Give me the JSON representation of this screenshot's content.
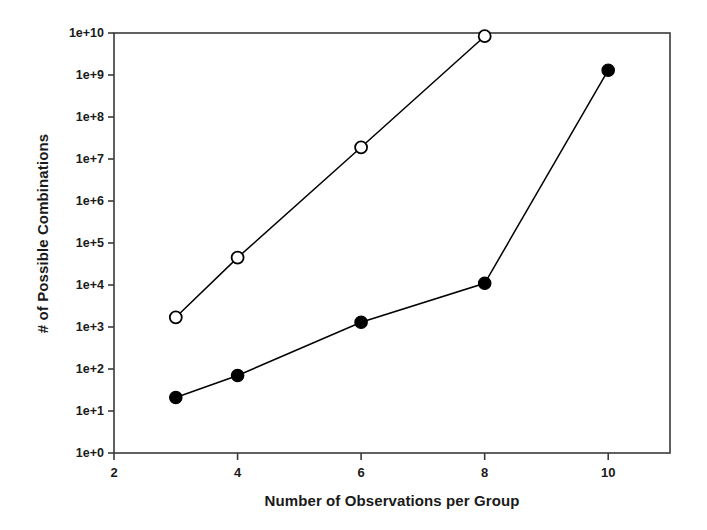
{
  "chart_data": {
    "type": "line",
    "title": "",
    "xlabel": "Number of Observations per Group",
    "ylabel": "# of Possible Combinations",
    "xlim": [
      2,
      11
    ],
    "ylim": [
      1,
      10000000000
    ],
    "yscale": "log",
    "grid": false,
    "legend": "none",
    "xticks": [
      "2",
      "4",
      "6",
      "8",
      "10"
    ],
    "xtick_values": [
      2,
      4,
      6,
      8,
      10
    ],
    "yticks": [
      "1e+0",
      "1e+1",
      "1e+2",
      "1e+3",
      "1e+4",
      "1e+5",
      "1e+6",
      "1e+7",
      "1e+8",
      "1e+9",
      "1e+10"
    ],
    "ytick_values": [
      1,
      10,
      100,
      1000,
      10000,
      100000,
      1000000,
      10000000,
      100000000,
      1000000000,
      10000000000
    ],
    "series": [
      {
        "name": "open-circle-series",
        "marker": "open-circle",
        "color": "#000000",
        "x": [
          3,
          4,
          6,
          8
        ],
        "values": [
          1700,
          45000,
          19000000,
          8400000000
        ]
      },
      {
        "name": "filled-circle-series",
        "marker": "filled-circle",
        "color": "#000000",
        "x": [
          3,
          4,
          6,
          8,
          10
        ],
        "values": [
          21,
          70,
          1300,
          11000,
          1300000000
        ]
      }
    ]
  },
  "figure": {
    "axis_color": "#3a3a3a",
    "background": "#ffffff"
  }
}
